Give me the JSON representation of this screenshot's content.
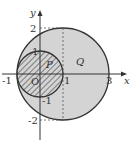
{
  "diagram": {
    "axes": {
      "x_label": "x",
      "y_label": "y",
      "origin_label": "O"
    },
    "x_ticks": [
      "-1",
      "1",
      "3"
    ],
    "y_ticks": [
      "2",
      "1",
      "-1",
      "-2"
    ],
    "regions": [
      {
        "name": "P",
        "shape": "circle",
        "center": [
          0,
          0
        ],
        "radius": 1,
        "fill": "hatched"
      },
      {
        "name": "Q",
        "shape": "circle",
        "center": [
          1,
          0
        ],
        "radius": 2,
        "fill": "#d4d4d4"
      }
    ],
    "dashed_line": {
      "x": 1,
      "from_y": -2,
      "to_y": 2
    },
    "colors": {
      "fill": "#d4d4d4",
      "stroke": "#333333",
      "background": "#ffffff"
    }
  }
}
